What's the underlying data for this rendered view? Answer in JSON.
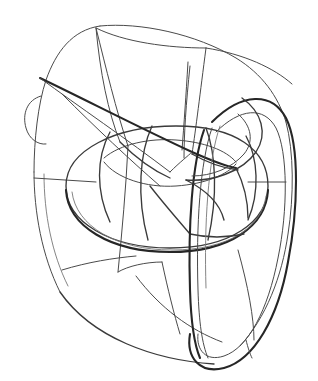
{
  "artwork": {
    "title": "Wireframe torus line drawing",
    "background_color": "#ffffff",
    "canvas": {
      "width": 318,
      "height": 381
    },
    "palette": {
      "heavy_stroke": "#262626",
      "medium_stroke": "#3a3a3a",
      "thin_stroke": "#4a4a4a",
      "faint_stroke": "#777777"
    },
    "description": "Hand-drawn contour sketch of a torus-like vortex form enclosed by a segmented outer shell, with a vertical ribbon loop on the right side and a pointed wedge sliver entering from the left.",
    "parts": {
      "outer_shell": "outer-shell-outline",
      "shell_panels": "shell-panel-seams",
      "inner_torus": "inner-torus-ring",
      "torus_meridians": "torus-meridian-seams",
      "right_loop": "right-ribbon-loop",
      "left_wedge": "left-pointed-wedge",
      "inner_funnel": "inner-funnel-walls"
    },
    "strokes": {
      "outer_shell_top": "M 100 26 C 72 30 56 52 46 80 C 38 104 34 140 34 172",
      "outer_shell_left": "M 34 172 C 34 212 42 256 60 292",
      "outer_shell_bottom": "M 60 292 C 92 338 154 360 214 364",
      "outer_shell_upper_right": "M 100 26 C 140 22 196 34 236 58 C 262 74 278 96 286 122",
      "outer_shell_right": "M 286 122 C 294 152 294 196 288 234 C 282 276 266 318 240 346",
      "left_bump": "M 41 96 C 27 100 22 114 26 128 C 29 139 38 145 46 144",
      "shell_seam_a": "M 96 28 C 106 68 116 110 128 146",
      "shell_seam_b": "M 128 146 C 126 188 122 232 118 272",
      "shell_seam_c": "M 34 178 L 96 182",
      "shell_seam_d": "M 286 182 L 248 182",
      "shell_seam_e": "M 190 66 C 186 104 184 134 184 158",
      "shell_seam_f": "M 136 276 C 160 308 190 330 222 342",
      "shell_seam_g": "M 62 270 C 88 262 114 258 136 256",
      "shell_seam_h": "M 238 250 C 248 286 254 318 254 340",
      "funnel_rim_back": "M 96 28 C 124 42 168 48 206 48",
      "funnel_wall_left": "M 96 28 C 100 72 108 112 120 142",
      "funnel_wall_right": "M 206 48 C 200 94 196 128 192 154",
      "funnel_wall_outer": "M 206 48 C 244 54 274 68 292 84",
      "funnel_inner_seam": "M 188 62 C 186 96 184 124 182 150",
      "inner_torus_outer": "M 66 186 C 66 150 116 126 176 126 C 236 126 268 150 268 186 C 268 222 230 248 170 248 C 110 248 66 222 66 186 Z",
      "inner_torus_lower": "M 66 190 C 68 226 110 252 170 252 C 230 252 266 226 268 190",
      "torus_hole_top": "M 104 158 C 120 144 150 138 176 140 C 204 142 226 150 236 162",
      "torus_hole_bottom": "M 104 162 C 116 178 146 188 176 186 C 206 184 228 174 236 164",
      "torus_meridian_1": "M 110 132 C 96 158 96 192 110 222",
      "torus_meridian_2": "M 152 126 C 140 152 136 196 148 240",
      "torus_meridian_3": "M 206 128 C 216 154 218 196 208 240",
      "torus_meridian_4": "M 246 136 C 258 158 260 192 248 220",
      "right_loop_outer": "M 212 122 C 242 92 272 92 286 118 C 300 146 298 210 288 262 C 278 318 254 360 224 368 C 200 374 186 358 190 334",
      "right_loop_inner": "M 216 132 C 240 108 264 106 276 128 C 288 152 288 210 278 258 C 268 310 248 348 224 356 C 206 362 196 350 198 334",
      "right_loop_cross_1": "M 204 130 C 192 164 188 226 190 290 C 191 322 194 344 200 358",
      "right_loop_cross_2": "M 212 128 C 200 162 196 226 198 290 C 199 322 202 344 208 358",
      "loop_tongue_outer": "M 242 98 C 262 112 268 134 256 152 C 242 172 212 182 186 180",
      "loop_tongue_inner": "M 238 114 C 252 126 254 142 244 154 C 232 168 212 176 192 176",
      "loop_tongue_tail": "M 186 180 C 206 190 220 204 224 220",
      "left_wedge_top": "M 40 78 C 86 100 140 128 192 152",
      "left_wedge_bottom": "M 40 78 C 78 106 128 140 170 172",
      "left_wedge_tip_join": "M 192 152 C 210 160 224 166 236 168",
      "wedge_under_curve": "M 62 94 C 96 128 130 160 160 186",
      "sliver_lower": "M 170 172 C 180 162 188 156 192 152",
      "inner_detail_1": "M 120 142 C 136 158 152 170 170 178",
      "inner_detail_2": "M 192 154 C 206 162 222 168 238 170",
      "inner_detail_3": "M 150 186 C 164 204 178 220 190 234",
      "inner_detail_4": "M 190 234 C 208 238 226 238 244 234",
      "inner_detail_5": "M 236 168 C 244 184 248 202 248 218",
      "lower_shell_fold": "M 118 272 C 128 266 146 262 162 262",
      "lower_shell_fold2": "M 162 262 C 168 290 174 314 180 334",
      "bottom_tick": "M 246 340 C 248 348 250 354 252 358",
      "faint_inner_torus": "M 72 192 C 76 226 116 250 172 250 C 228 250 262 228 266 196",
      "faint_shell_left": "M 44 174 C 44 214 52 254 68 286",
      "faint_loop_edge": "M 220 126 C 208 160 204 224 206 288"
    }
  }
}
